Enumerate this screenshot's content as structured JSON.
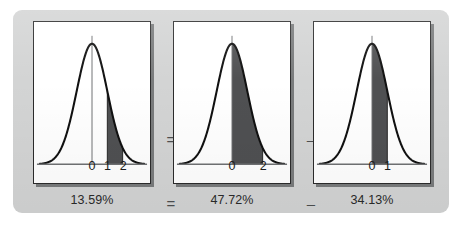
{
  "figure": {
    "background_color": "#d3d4d4",
    "panel_background": "#ffffff",
    "curve_color": "#111111",
    "shade_color": "#4f5052",
    "axis_color": "#6f7173",
    "border_color": "#2b2b2b"
  },
  "operators": {
    "between_1_2_middle": "=",
    "between_2_3_middle": "–",
    "between_1_2_bottom": "=",
    "between_2_3_bottom": "–"
  },
  "chart_data": [
    {
      "type": "area",
      "title": "",
      "xlabel": "",
      "ylabel": "",
      "distribution": "standard normal",
      "mean": 0,
      "sd": 1,
      "xlim": [
        -3.4,
        3.4
      ],
      "grid": false,
      "legend": null,
      "tick_labels": [
        "0",
        "1",
        "2"
      ],
      "tick_values": [
        0,
        1,
        2
      ],
      "shaded_interval": [
        1,
        2
      ],
      "center_line_at": 0,
      "area_label": "13.59%",
      "area_value": 13.59
    },
    {
      "type": "area",
      "title": "",
      "xlabel": "",
      "ylabel": "",
      "distribution": "standard normal",
      "mean": 0,
      "sd": 1,
      "xlim": [
        -3.4,
        3.4
      ],
      "grid": false,
      "legend": null,
      "tick_labels": [
        "0",
        "2"
      ],
      "tick_values": [
        0,
        2
      ],
      "shaded_interval": [
        0,
        2
      ],
      "center_line_at": 0,
      "area_label": "47.72%",
      "area_value": 47.72
    },
    {
      "type": "area",
      "title": "",
      "xlabel": "",
      "ylabel": "",
      "distribution": "standard normal",
      "mean": 0,
      "sd": 1,
      "xlim": [
        -3.4,
        3.4
      ],
      "grid": false,
      "legend": null,
      "tick_labels": [
        "0",
        "1"
      ],
      "tick_values": [
        0,
        1
      ],
      "shaded_interval": [
        0,
        1
      ],
      "center_line_at": 0,
      "area_label": "34.13%",
      "area_value": 34.13
    }
  ]
}
